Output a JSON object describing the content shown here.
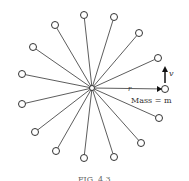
{
  "diagram": {
    "center": [
      92,
      88
    ],
    "nodes": [
      [
        84,
        15
      ],
      [
        114,
        17
      ],
      [
        139,
        33
      ],
      [
        158,
        58
      ],
      [
        165,
        89
      ],
      [
        159,
        118
      ],
      [
        141,
        143
      ],
      [
        114,
        157
      ],
      [
        84,
        158
      ],
      [
        56,
        151
      ],
      [
        35,
        132
      ],
      [
        22,
        104
      ],
      [
        22,
        74
      ],
      [
        33,
        47
      ],
      [
        55,
        25
      ]
    ],
    "labels": {
      "radius": "r",
      "velocity": "v",
      "mass": "Mass = m",
      "caption": "FIG. 4.3"
    }
  }
}
